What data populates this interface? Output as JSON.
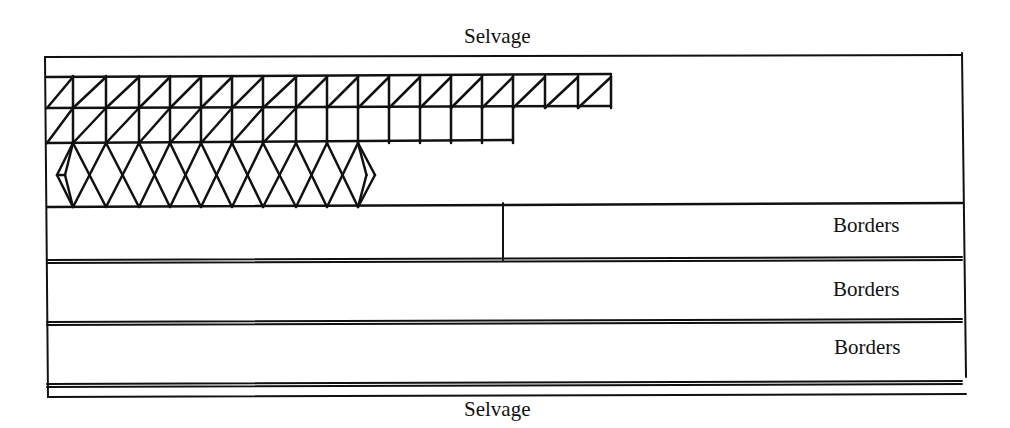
{
  "diagram": {
    "labels": {
      "selvage_top": "Selvage",
      "selvage_bottom": "Selvage",
      "borders": [
        "Borders",
        "Borders",
        "Borders"
      ]
    },
    "colors": {
      "ink": "#111111",
      "background": "#ffffff"
    },
    "frame": {
      "left": 45,
      "top": 57,
      "right": 962,
      "bottom": 397
    },
    "pattern": {
      "columns_x": [
        47,
        73,
        106,
        139,
        170,
        201,
        232,
        263,
        296,
        327,
        358,
        389,
        420,
        451,
        482,
        513,
        545,
        578,
        611
      ],
      "row1": {
        "top": 77,
        "bottom": 108,
        "end_x": 611,
        "diagonals": "all"
      },
      "row2": {
        "top": 108,
        "bottom": 143,
        "end_x": 513,
        "diagonal_end_x": 296
      },
      "diamonds": {
        "top": 143,
        "bottom": 207,
        "apex_x": [
          73,
          106,
          139,
          170,
          201,
          232,
          263,
          296,
          327,
          358
        ],
        "left_tip_x": 57,
        "right_tip_x": 375
      }
    },
    "border_bands": [
      {
        "top": 203,
        "bottom": 260,
        "divider_x": 503
      },
      {
        "top": 266,
        "bottom": 322
      },
      {
        "top": 328,
        "bottom": 384
      }
    ]
  }
}
